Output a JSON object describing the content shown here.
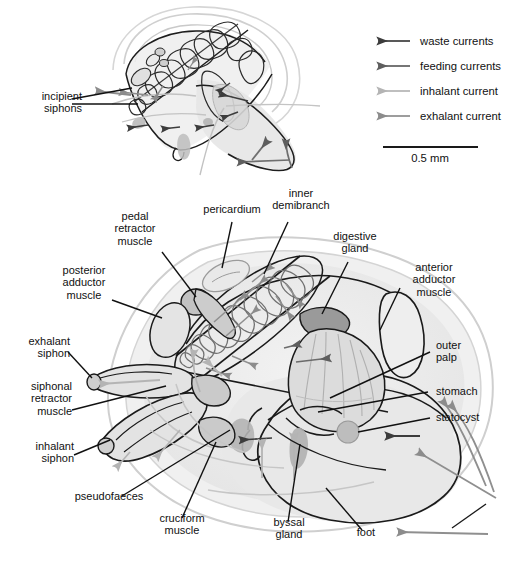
{
  "figure": {
    "scale_bar": {
      "label": "0.5 mm",
      "length_px": 95
    }
  },
  "legend": {
    "items": [
      {
        "label": "waste currents",
        "color": "#3c3c3c",
        "icon": "left-arrow-icon"
      },
      {
        "label": "feeding currents",
        "color": "#5e5e5e",
        "icon": "left-arrow-icon"
      },
      {
        "label": "inhalant current",
        "color": "#b4b4b4",
        "icon": "left-arrow-icon"
      },
      {
        "label": "exhalant current",
        "color": "#8c8c8c",
        "icon": "left-arrow-icon"
      }
    ]
  },
  "top_diagram": {
    "labels": [
      {
        "id": "incipient-siphons",
        "text": "incipient\nsiphons"
      }
    ]
  },
  "main_diagram": {
    "labels": [
      {
        "id": "pedal-retractor-muscle",
        "text": "pedal\nretractor\nmuscle"
      },
      {
        "id": "pericardium",
        "text": "pericardium"
      },
      {
        "id": "inner-demibranch",
        "text": "inner\ndemibranch"
      },
      {
        "id": "digestive-gland",
        "text": "digestive\ngland"
      },
      {
        "id": "anterior-adductor-muscle",
        "text": "anterior\nadductor\nmuscle"
      },
      {
        "id": "posterior-adductor-muscle",
        "text": "posterior\nadductor\nmuscle"
      },
      {
        "id": "exhalant-siphon",
        "text": "exhalant\nsiphon"
      },
      {
        "id": "siphonal-retractor-muscle",
        "text": "siphonal\nretractor\nmuscle"
      },
      {
        "id": "inhalant-siphon",
        "text": "inhalant\nsiphon"
      },
      {
        "id": "pseudofaeces",
        "text": "pseudofaeces"
      },
      {
        "id": "cruciform-muscle",
        "text": "cruciform\nmuscle"
      },
      {
        "id": "byssal-gland",
        "text": "byssal\ngland"
      },
      {
        "id": "foot",
        "text": "foot"
      },
      {
        "id": "outer-palp",
        "text": "outer\npalp"
      },
      {
        "id": "stomach",
        "text": "stomach"
      },
      {
        "id": "statocyst",
        "text": "statocyst"
      }
    ]
  },
  "colors": {
    "outline": "#1a1a1a",
    "shell_outline": "#b9b9b9",
    "body_fill": "#ececec",
    "mantle_fill": "#e2e2e2",
    "muscle_fill": "#dcdcdc",
    "muscle_fill_dark": "#c2c2c2",
    "gland_fill": "#a9a9a9",
    "organ_fill": "#b5b5b5",
    "gill_stroke": "#6a6a6a",
    "palp_fill": "#d4d4d4",
    "waste_arrow": "#3c3c3c",
    "feeding_arrow": "#5e5e5e",
    "inhalant_arrow": "#b4b4b4",
    "exhalant_arrow": "#8c8c8c"
  }
}
